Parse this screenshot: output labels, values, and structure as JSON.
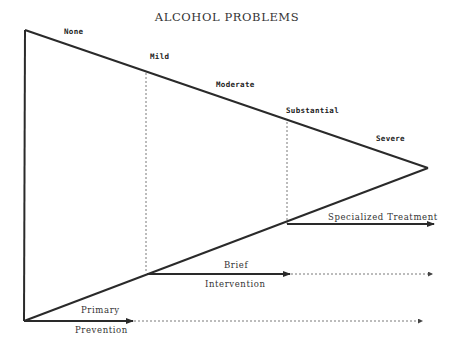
{
  "diagram": {
    "title": "ALCOHOL PROBLEMS",
    "severity_levels": [
      {
        "label": "None"
      },
      {
        "label": "Mild"
      },
      {
        "label": "Moderate"
      },
      {
        "label": "Substantial"
      },
      {
        "label": "Severe"
      }
    ],
    "interventions": {
      "specialized": {
        "label": "Specialized Treatment"
      },
      "brief": {
        "label_top": "Brief",
        "label_bottom": "Intervention"
      },
      "primary": {
        "label_top": "Primary",
        "label_bottom": "Prevention"
      }
    },
    "colors": {
      "line": "#2a2a2a",
      "text": "#333333",
      "background": "#ffffff"
    }
  }
}
